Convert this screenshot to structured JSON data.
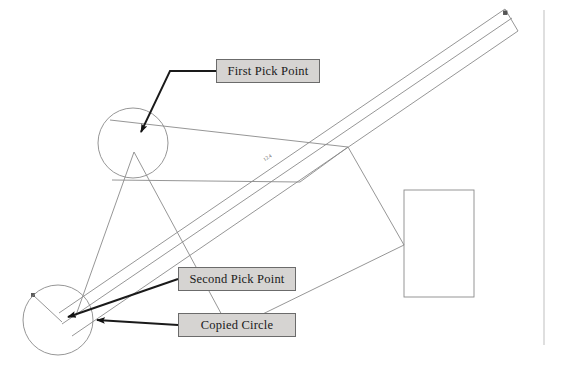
{
  "figure": {
    "background_color": "#ffffff",
    "line_color": "#8a8a8a",
    "annotation_line_color": "#1a1a1a",
    "callout_fill": "#d6d4d2",
    "callout_border": "#6b6b6b"
  },
  "callouts": [
    {
      "id": "first-pick-point",
      "label": "First Pick Point"
    },
    {
      "id": "second-pick-point",
      "label": "Second Pick Point"
    },
    {
      "id": "copied-circle",
      "label": "Copied Circle"
    }
  ],
  "dimension_text": {
    "beam_label": "12.4"
  },
  "geometry": {
    "circles": [
      {
        "name": "original-circle",
        "cx": 133,
        "cy": 143,
        "r": 35
      },
      {
        "name": "copied-circle",
        "cx": 58,
        "cy": 320,
        "r": 35
      }
    ],
    "rectangle": {
      "x": 404,
      "y": 190,
      "width": 70,
      "height": 107
    },
    "beam": {
      "start": [
        60,
        320
      ],
      "end": [
        507,
        14
      ]
    },
    "border_line": {
      "x": 544,
      "y1": 10,
      "y2": 345
    }
  }
}
